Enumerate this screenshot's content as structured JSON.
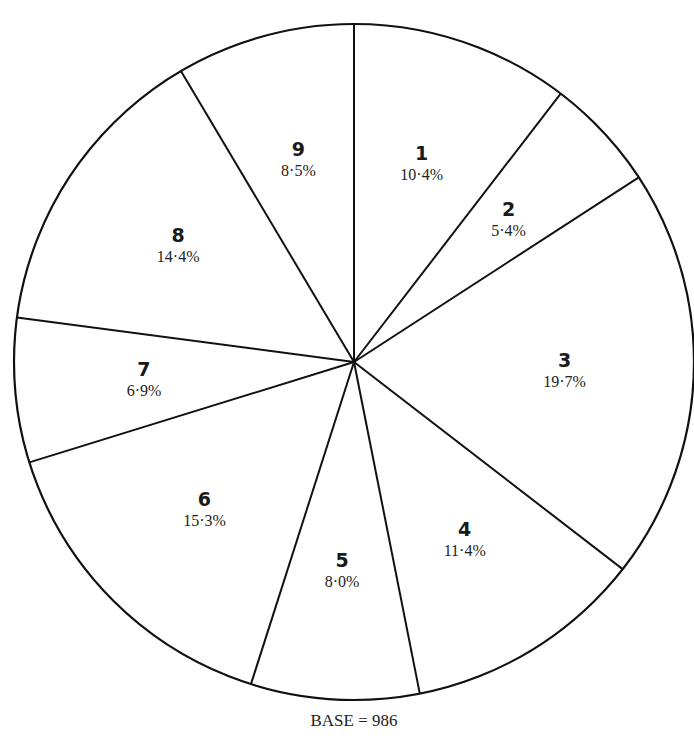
{
  "chart_data": {
    "type": "pie",
    "title": "",
    "start_angle_deg": 0,
    "direction": "clockwise",
    "categories": [
      "1",
      "2",
      "3",
      "4",
      "5",
      "6",
      "7",
      "8",
      "9"
    ],
    "values": [
      10.4,
      5.4,
      19.7,
      11.4,
      8.0,
      15.3,
      6.9,
      14.4,
      8.5
    ],
    "labels": [
      "10·4%",
      "5·4%",
      "19·7%",
      "11·4%",
      "8·0%",
      "15·3%",
      "6·9%",
      "14·4%",
      "8·5%"
    ],
    "unit": "%",
    "footnote": "BASE = 986",
    "base": 986,
    "fill_color": "#ffffff",
    "stroke_color": "#111111"
  },
  "geometry": {
    "cx": 354,
    "cy": 362,
    "rx": 340,
    "ry": 338
  }
}
